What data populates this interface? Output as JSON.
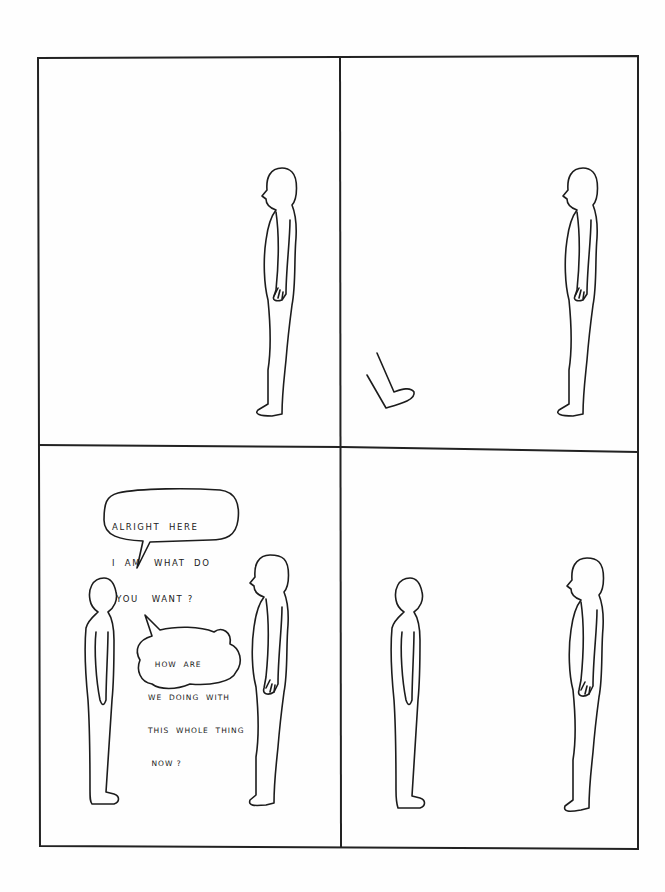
{
  "comic": {
    "layout": "2x2 grid",
    "panels": [
      {
        "id": 1,
        "description": "A bald featureless figure stands in profile facing left on the right side of an empty panel."
      },
      {
        "id": 2,
        "description": "The same figure stands on the right; a disembodied leg/foot enters from the lower left."
      },
      {
        "id": 3,
        "description": "Two figures face each other; a simpler round-headed figure on the left and the bald profile figure on the right, exchanging speech bubbles."
      },
      {
        "id": 4,
        "description": "The two figures stand silently facing each other."
      }
    ],
    "speech_bubbles": [
      {
        "panel": 3,
        "speaker": "left-figure",
        "lines": [
          "ALRIGHT  HERE",
          "I  AM   WHAT  DO",
          " YOU   WANT ?"
        ]
      },
      {
        "panel": 3,
        "speaker": "right-figure",
        "lines": [
          "  HOW  ARE",
          "WE  DOING  WITH",
          "THIS  WHOLE  THING",
          " NOW ?"
        ]
      }
    ]
  },
  "colors": {
    "ink": "#1c1c1c",
    "paper": "#fefefe"
  }
}
